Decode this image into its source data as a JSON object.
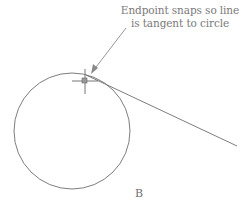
{
  "annotation": {
    "line1": "Endpoint snaps so line",
    "line2": "is tangent to circle"
  },
  "figure_label": "B",
  "colors": {
    "stroke": "#7a7a7a",
    "text": "#7a7a7a"
  }
}
